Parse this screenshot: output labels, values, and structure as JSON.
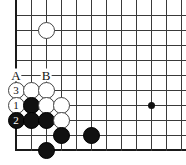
{
  "figure": {
    "kind": "go-board-diagram",
    "width": 186,
    "height": 165,
    "background": "#ffffff",
    "line_color": "#3a3a3a",
    "edge_color": "#1a1a1a",
    "black_color": "#111111",
    "white_color": "#ffffff"
  },
  "board": {
    "origin_x": 16,
    "origin_y": 15,
    "spacing": 15,
    "cols": 12,
    "rows": 9,
    "left_edge_is_board_edge": true,
    "bottom_edge_is_board_edge": true,
    "hoshi": [
      {
        "name": "star-point-right",
        "col": 9,
        "row": 6
      }
    ]
  },
  "stones": [
    {
      "name": "white-stone-top",
      "color": "white",
      "col": 2,
      "row": 1,
      "number": ""
    },
    {
      "name": "white-stone-3",
      "color": "white",
      "col": 0,
      "row": 5,
      "number": "3"
    },
    {
      "name": "white-stone-a-below",
      "color": "white",
      "col": 1,
      "row": 5,
      "number": ""
    },
    {
      "name": "white-stone-b-below",
      "color": "white",
      "col": 2,
      "row": 5,
      "number": ""
    },
    {
      "name": "white-stone-1",
      "color": "white",
      "col": 0,
      "row": 6,
      "number": "1"
    },
    {
      "name": "black-stone-upper",
      "color": "black",
      "col": 1,
      "row": 6,
      "number": ""
    },
    {
      "name": "white-stone-mid",
      "color": "white",
      "col": 2,
      "row": 6,
      "number": ""
    },
    {
      "name": "white-stone-mid-right",
      "color": "white",
      "col": 3,
      "row": 6,
      "number": ""
    },
    {
      "name": "black-stone-2",
      "color": "black",
      "col": 0,
      "row": 7,
      "number": "2"
    },
    {
      "name": "black-stone-row7-b",
      "color": "black",
      "col": 1,
      "row": 7,
      "number": ""
    },
    {
      "name": "black-stone-row7-c",
      "color": "black",
      "col": 2,
      "row": 7,
      "number": ""
    },
    {
      "name": "white-stone-row7-d",
      "color": "white",
      "col": 3,
      "row": 7,
      "number": ""
    },
    {
      "name": "black-stone-row8-d",
      "color": "black",
      "col": 3,
      "row": 8,
      "number": ""
    },
    {
      "name": "black-stone-row8-f",
      "color": "black",
      "col": 5,
      "row": 8,
      "number": ""
    },
    {
      "name": "black-stone-row9-c",
      "color": "black",
      "col": 2,
      "row": 9,
      "number": ""
    }
  ],
  "point_labels": [
    {
      "name": "point-label-a",
      "text": "A",
      "col": 0,
      "row": 4
    },
    {
      "name": "point-label-b",
      "text": "B",
      "col": 2,
      "row": 4
    }
  ]
}
